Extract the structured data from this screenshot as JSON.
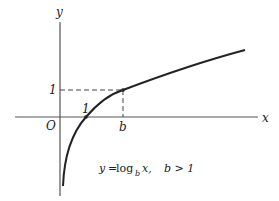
{
  "diagram": {
    "axes": {
      "x_label": "x",
      "y_label": "y",
      "origin_label": "O"
    },
    "tick_labels": {
      "y_one": "1",
      "x_one": "1",
      "x_b": "b"
    },
    "caption": {
      "lhs": "y",
      "eq": "=",
      "func": "log",
      "base": "b",
      "arg": "x,",
      "condition": "b > 1"
    },
    "points": [
      {
        "name": "x-intercept",
        "coords": "(1, 0)"
      },
      {
        "name": "base-point",
        "coords": "(b, 1)"
      }
    ],
    "colors": {
      "stroke": "#222222",
      "axis": "#555555",
      "background": "#ffffff"
    }
  }
}
